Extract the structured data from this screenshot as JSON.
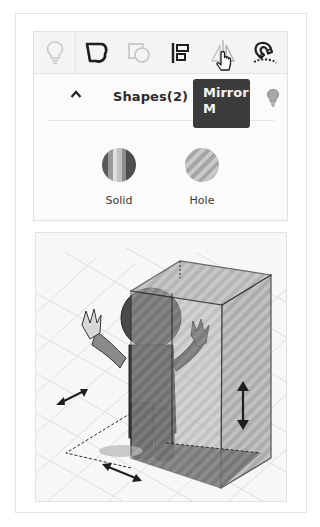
{
  "toolbar": {
    "tools": [
      {
        "name": "notes-lightbulb",
        "icon": "lightbulb-icon",
        "state": "disabled"
      },
      {
        "name": "shape",
        "icon": "solid-shape-icon",
        "state": "active"
      },
      {
        "name": "hole",
        "icon": "hole-shape-icon",
        "state": "disabled"
      },
      {
        "name": "align",
        "icon": "align-icon",
        "state": "active"
      },
      {
        "name": "mirror",
        "icon": "mirror-icon",
        "state": "hovered"
      },
      {
        "name": "cruise",
        "icon": "magnet-icon",
        "state": "active"
      }
    ]
  },
  "tooltip": {
    "title": "Mirror",
    "shortcut": "M"
  },
  "shapes_panel": {
    "title": "Shapes(2)",
    "expanded": true,
    "items": [
      {
        "label": "Solid",
        "icon": "solid-swatch-icon"
      },
      {
        "label": "Hole",
        "icon": "hole-swatch-icon"
      }
    ]
  },
  "viewport": {
    "description": "3D workplane with a cartoon figure overlapped by a transparent striped box (hole)",
    "handles": [
      "width-arrow",
      "depth-arrow",
      "height-arrow"
    ]
  },
  "colors": {
    "toolbar_bg": "#f4f4f4",
    "tooltip_bg": "#3b3b3b",
    "icon_dark": "#1e1e1e",
    "icon_disabled": "#c4c4c4"
  }
}
